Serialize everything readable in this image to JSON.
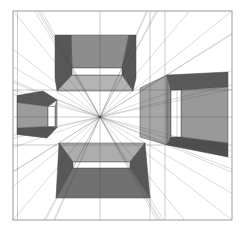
{
  "canvas": {
    "width": 241,
    "height": 230,
    "background": "#ffffff"
  },
  "frame": {
    "x": 13,
    "y": 11,
    "w": 219,
    "h": 209,
    "stroke": "#9a9a9a",
    "stroke_width": 1
  },
  "vanishing_point": {
    "x": 100,
    "y": 117
  },
  "palette": {
    "face_light": "#b4b4b4",
    "face_medium": "#979797",
    "face_dark": "#585858",
    "line": "rgba(70,70,70,0.40)",
    "ray": "rgba(70,70,70,0.32)",
    "face_outline": "#4d4d4d",
    "hole": "#ffffff"
  },
  "grid": {
    "verticals": [
      17.5,
      100,
      150,
      165
    ],
    "horizontals": [
      90,
      117,
      145
    ],
    "stroke_width": 0.7
  },
  "rays": {
    "stroke_width": 0.6,
    "anchors": [
      [
        13,
        11
      ],
      [
        232,
        11
      ],
      [
        13,
        220
      ],
      [
        232,
        220
      ],
      [
        55,
        35
      ],
      [
        136,
        35
      ],
      [
        72,
        68
      ],
      [
        122,
        68
      ],
      [
        56,
        198
      ],
      [
        150,
        198
      ],
      [
        59,
        143
      ],
      [
        145,
        143
      ],
      [
        73,
        168
      ],
      [
        130,
        168
      ],
      [
        228,
        72
      ],
      [
        228,
        157
      ],
      [
        167,
        75
      ],
      [
        167,
        145
      ],
      [
        17,
        95.5
      ],
      [
        17,
        134.5
      ],
      [
        57,
        100
      ],
      [
        57,
        127.5
      ]
    ]
  },
  "extra_lines": [
    {
      "name": "right-box-inner-corner-edge",
      "x1": 177,
      "y1": 90,
      "x2": 177,
      "y2": 137
    }
  ],
  "boxes": [
    {
      "name": "top-box",
      "faces": [
        {
          "name": "top-box-top-face",
          "fill": "#8d8d8d",
          "points": [
            [
              71,
              35
            ],
            [
              129,
              35
            ],
            [
              122,
              68
            ],
            [
              72,
              68
            ]
          ]
        },
        {
          "name": "top-box-left-face",
          "fill": "#585858",
          "points": [
            [
              55,
              35
            ],
            [
              71,
              35
            ],
            [
              72,
              68
            ],
            [
              72,
              75
            ],
            [
              57,
              91
            ],
            [
              55,
              78
            ]
          ]
        },
        {
          "name": "top-box-right-face",
          "fill": "#585858",
          "points": [
            [
              129,
              35
            ],
            [
              136,
              35
            ],
            [
              136,
              78
            ],
            [
              133,
              91
            ],
            [
              122,
              75
            ],
            [
              122,
              68
            ]
          ]
        },
        {
          "name": "top-box-bottom-face",
          "fill": "#b4b4b4",
          "points": [
            [
              72,
              75
            ],
            [
              122,
              75
            ],
            [
              133,
              91
            ],
            [
              57,
              91
            ]
          ]
        },
        {
          "name": "top-box-hole",
          "fill": "#ffffff",
          "points": [
            [
              72,
              68
            ],
            [
              122,
              68
            ],
            [
              122,
              75
            ],
            [
              72,
              75
            ]
          ]
        }
      ]
    },
    {
      "name": "bottom-box",
      "faces": [
        {
          "name": "bottom-box-top-face",
          "fill": "#adadad",
          "points": [
            [
              59,
              143
            ],
            [
              145,
              143
            ],
            [
              130,
              162
            ],
            [
              73,
              162
            ]
          ]
        },
        {
          "name": "bottom-box-left-face",
          "fill": "#585858",
          "points": [
            [
              59,
              143
            ],
            [
              73,
              162
            ],
            [
              73,
              168
            ],
            [
              56,
              198
            ]
          ]
        },
        {
          "name": "bottom-box-right-face",
          "fill": "#585858",
          "points": [
            [
              145,
              143
            ],
            [
              150,
              198
            ],
            [
              130,
              168
            ],
            [
              130,
              162
            ]
          ]
        },
        {
          "name": "bottom-box-front-face",
          "fill": "#717171",
          "points": [
            [
              73,
              168
            ],
            [
              130,
              168
            ],
            [
              150,
              198
            ],
            [
              56,
              198
            ]
          ]
        },
        {
          "name": "bottom-box-hole",
          "fill": "#ffffff",
          "points": [
            [
              73,
              162
            ],
            [
              130,
              162
            ],
            [
              130,
              168
            ],
            [
              73,
              168
            ]
          ]
        }
      ]
    },
    {
      "name": "right-box",
      "faces": [
        {
          "name": "right-box-outer-left-face",
          "fill": "#a6a6a6",
          "points": [
            [
              140,
              88
            ],
            [
              167,
              75
            ],
            [
              167,
              145
            ],
            [
              140,
              137
            ]
          ]
        },
        {
          "name": "right-box-near-ring",
          "fill": "#8a8a8a",
          "points": [
            [
              167,
              75
            ],
            [
              171,
              90
            ],
            [
              171,
              137
            ],
            [
              167,
              145
            ]
          ]
        },
        {
          "name": "right-box-top-face",
          "fill": "#5a5a5a",
          "points": [
            [
              167,
              75
            ],
            [
              228,
              72
            ],
            [
              228,
              87
            ],
            [
              181,
              90
            ],
            [
              171,
              90
            ]
          ]
        },
        {
          "name": "right-box-bottom-face",
          "fill": "#4f4f4f",
          "points": [
            [
              167,
              145
            ],
            [
              171,
              137
            ],
            [
              181,
              137
            ],
            [
              228,
              143
            ],
            [
              228,
              157
            ]
          ]
        },
        {
          "name": "right-box-inner-wall",
          "fill": "#999999",
          "points": [
            [
              181,
              90
            ],
            [
              228,
              87
            ],
            [
              228,
              143
            ],
            [
              181,
              137
            ]
          ]
        },
        {
          "name": "right-box-hole",
          "fill": "#ffffff",
          "points": [
            [
              171,
              90
            ],
            [
              181,
              90
            ],
            [
              181,
              137
            ],
            [
              171,
              137
            ]
          ]
        }
      ]
    },
    {
      "name": "left-box",
      "faces": [
        {
          "name": "left-box-top-face",
          "fill": "#5a5a5a",
          "points": [
            [
              17,
              95.5
            ],
            [
              43,
              91
            ],
            [
              57,
              100
            ],
            [
              48,
              106.5
            ],
            [
              17,
              102.5
            ]
          ]
        },
        {
          "name": "left-box-bottom-face",
          "fill": "#565656",
          "points": [
            [
              17,
              128
            ],
            [
              48,
              126.5
            ],
            [
              57,
              127.5
            ],
            [
              47,
              138
            ],
            [
              17,
              134.5
            ]
          ]
        },
        {
          "name": "left-box-front-wall",
          "fill": "#9b9b9b",
          "points": [
            [
              17,
              102.5
            ],
            [
              48,
              106.5
            ],
            [
              48,
              126.5
            ],
            [
              17,
              128
            ]
          ]
        },
        {
          "name": "left-box-far-sliver",
          "fill": "#a0a0a0",
          "points": [
            [
              55,
              106.5
            ],
            [
              57,
              100
            ],
            [
              57,
              127.5
            ],
            [
              55,
              126.5
            ]
          ]
        },
        {
          "name": "left-box-hole",
          "fill": "#ffffff",
          "points": [
            [
              48,
              106.5
            ],
            [
              55,
              106.5
            ],
            [
              55,
              126.5
            ],
            [
              48,
              126.5
            ]
          ]
        }
      ]
    }
  ]
}
